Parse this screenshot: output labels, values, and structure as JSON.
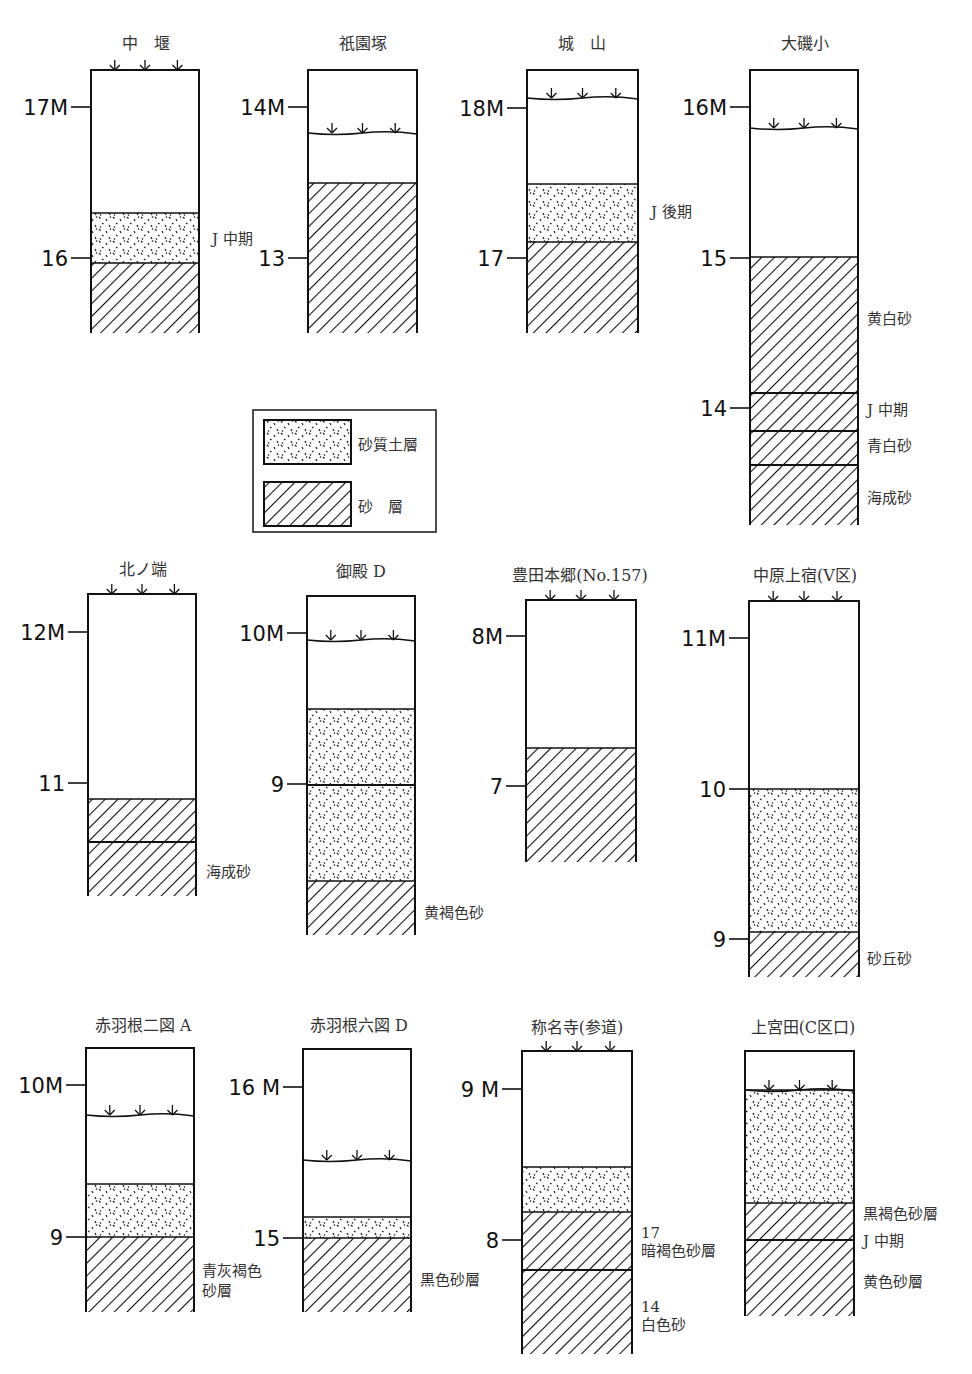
{
  "legend": {
    "items": [
      {
        "pattern": "dots",
        "label": "砂質土層"
      },
      {
        "pattern": "hatch",
        "label": "砂　層"
      }
    ],
    "box": {
      "x": 253,
      "y": 410,
      "w": 183,
      "h": 122
    }
  },
  "columns": [
    {
      "id": "nakaseki",
      "title": "中　堰",
      "titleX": 146,
      "titleY": 49,
      "x": 91,
      "w": 108,
      "top": 70,
      "bottom": 333,
      "surface": {
        "y": 70,
        "onTop": true
      },
      "ticks": [
        {
          "label": "17M",
          "y": 107
        },
        {
          "label": "16",
          "y": 258
        }
      ],
      "layers": [
        {
          "type": "dots",
          "y1": 213,
          "y2": 263
        },
        {
          "type": "hatch",
          "y1": 263,
          "y2": 333
        }
      ],
      "lines": [],
      "notes": [
        {
          "text": "J 中期",
          "x": 212,
          "y": 244
        }
      ]
    },
    {
      "id": "gionzuka",
      "title": "祇園塚",
      "titleX": 363,
      "titleY": 49,
      "x": 308,
      "w": 109,
      "top": 70,
      "bottom": 333,
      "surface": {
        "y": 133,
        "onTop": false
      },
      "ticks": [
        {
          "label": "14M",
          "y": 107
        },
        {
          "label": "13",
          "y": 258
        }
      ],
      "layers": [
        {
          "type": "hatch",
          "y1": 183,
          "y2": 333
        }
      ],
      "lines": [],
      "notes": []
    },
    {
      "id": "shiroyama",
      "title": "城　山",
      "titleX": 582,
      "titleY": 49,
      "x": 527,
      "w": 111,
      "top": 70,
      "bottom": 333,
      "surface": {
        "y": 98,
        "onTop": false
      },
      "ticks": [
        {
          "label": "18M",
          "y": 108
        },
        {
          "label": "17",
          "y": 258
        }
      ],
      "layers": [
        {
          "type": "dots",
          "y1": 184,
          "y2": 242
        },
        {
          "type": "hatch",
          "y1": 242,
          "y2": 333
        }
      ],
      "lines": [],
      "notes": [
        {
          "text": "J 後期",
          "x": 651,
          "y": 217
        }
      ]
    },
    {
      "id": "oisoshou",
      "title": "大磯小",
      "titleX": 805,
      "titleY": 49,
      "x": 750,
      "w": 108,
      "top": 70,
      "bottom": 525,
      "surface": {
        "y": 128,
        "onTop": false
      },
      "ticks": [
        {
          "label": "16M",
          "y": 107
        },
        {
          "label": "15",
          "y": 258
        },
        {
          "label": "14",
          "y": 408
        }
      ],
      "layers": [
        {
          "type": "hatch",
          "y1": 257,
          "y2": 525
        }
      ],
      "lines": [
        393,
        431,
        465
      ],
      "notes": [
        {
          "text": "黄白砂",
          "x": 867,
          "y": 324
        },
        {
          "text": "J 中期",
          "x": 867,
          "y": 415
        },
        {
          "text": "青白砂",
          "x": 867,
          "y": 451
        },
        {
          "text": "海成砂",
          "x": 867,
          "y": 503
        }
      ]
    },
    {
      "id": "kitanohata",
      "title": "北ノ端",
      "titleX": 143,
      "titleY": 575,
      "x": 88,
      "w": 108,
      "top": 594,
      "bottom": 896,
      "surface": {
        "y": 594,
        "onTop": true
      },
      "ticks": [
        {
          "label": "12M",
          "y": 632
        },
        {
          "label": "11",
          "y": 783
        }
      ],
      "layers": [
        {
          "type": "hatch",
          "y1": 799,
          "y2": 896
        }
      ],
      "lines": [
        842
      ],
      "notes": [
        {
          "text": "海成砂",
          "x": 206,
          "y": 877
        }
      ]
    },
    {
      "id": "gotenD",
      "title": "御殿 D",
      "titleX": 361,
      "titleY": 577,
      "x": 307,
      "w": 108,
      "top": 596,
      "bottom": 935,
      "surface": {
        "y": 640,
        "onTop": false
      },
      "ticks": [
        {
          "label": "10M",
          "y": 633
        },
        {
          "label": "9",
          "y": 784
        }
      ],
      "layers": [
        {
          "type": "dots",
          "y1": 709,
          "y2": 881
        },
        {
          "type": "hatch",
          "y1": 881,
          "y2": 935
        }
      ],
      "lines": [
        785
      ],
      "notes": [
        {
          "text": "黄褐色砂",
          "x": 424,
          "y": 918
        }
      ]
    },
    {
      "id": "toyodahongou",
      "title": "豊田本郷(No.157)",
      "titleX": 580,
      "titleY": 581,
      "x": 526,
      "w": 110,
      "top": 600,
      "bottom": 862,
      "surface": {
        "y": 600,
        "onTop": true
      },
      "ticks": [
        {
          "label": "8M",
          "y": 636
        },
        {
          "label": "7",
          "y": 786
        }
      ],
      "layers": [
        {
          "type": "hatch",
          "y1": 748,
          "y2": 862
        }
      ],
      "lines": [],
      "notes": []
    },
    {
      "id": "nakaharakamishuku",
      "title": "中原上宿(V区)",
      "titleX": 805,
      "titleY": 581,
      "x": 749,
      "w": 110,
      "top": 601,
      "bottom": 977,
      "surface": {
        "y": 601,
        "onTop": true
      },
      "ticks": [
        {
          "label": "11M",
          "y": 638
        },
        {
          "label": "10",
          "y": 789
        },
        {
          "label": "9",
          "y": 939
        }
      ],
      "layers": [
        {
          "type": "dots",
          "y1": 789,
          "y2": 932
        },
        {
          "type": "hatch",
          "y1": 932,
          "y2": 977
        }
      ],
      "lines": [],
      "notes": [
        {
          "text": "砂丘砂",
          "x": 867,
          "y": 964
        }
      ]
    },
    {
      "id": "akabane2A",
      "title": "赤羽根二図 A",
      "titleX": 143,
      "titleY": 1031,
      "x": 86,
      "w": 108,
      "top": 1048,
      "bottom": 1312,
      "surface": {
        "y": 1115,
        "onTop": false
      },
      "ticks": [
        {
          "label": "10M",
          "y": 1085
        },
        {
          "label": "9",
          "y": 1237
        }
      ],
      "layers": [
        {
          "type": "dots",
          "y1": 1184,
          "y2": 1237
        },
        {
          "type": "hatch",
          "y1": 1237,
          "y2": 1312
        }
      ],
      "lines": [],
      "notes": [
        {
          "text": "青灰褐色",
          "x": 202,
          "y": 1276
        },
        {
          "text": "砂層",
          "x": 202,
          "y": 1296
        }
      ]
    },
    {
      "id": "akabane6D",
      "title": "赤羽根六図 D",
      "titleX": 359,
      "titleY": 1031,
      "x": 303,
      "w": 108,
      "top": 1049,
      "bottom": 1312,
      "surface": {
        "y": 1160,
        "onTop": false
      },
      "ticks": [
        {
          "label": "16 M",
          "y": 1087
        },
        {
          "label": "15",
          "y": 1238
        }
      ],
      "layers": [
        {
          "type": "dots",
          "y1": 1217,
          "y2": 1238
        },
        {
          "type": "hatch",
          "y1": 1238,
          "y2": 1312
        }
      ],
      "lines": [],
      "notes": [
        {
          "text": "黒色砂層",
          "x": 420,
          "y": 1285
        }
      ]
    },
    {
      "id": "shomyoji",
      "title": "称名寺(参道)",
      "titleX": 577,
      "titleY": 1033,
      "x": 522,
      "w": 110,
      "top": 1051,
      "bottom": 1354,
      "surface": {
        "y": 1051,
        "onTop": true
      },
      "ticks": [
        {
          "label": "9 M",
          "y": 1089
        },
        {
          "label": "8",
          "y": 1240
        }
      ],
      "layers": [
        {
          "type": "dots",
          "y1": 1167,
          "y2": 1212
        },
        {
          "type": "hatch",
          "y1": 1212,
          "y2": 1354
        }
      ],
      "lines": [
        1270
      ],
      "notes": [
        {
          "text": "17",
          "x": 641,
          "y": 1238
        },
        {
          "text": "暗褐色砂層",
          "x": 641,
          "y": 1256
        },
        {
          "text": "14",
          "x": 641,
          "y": 1312
        },
        {
          "text": "白色砂",
          "x": 641,
          "y": 1330
        }
      ]
    },
    {
      "id": "kamimiyata",
      "title": "上宮田(C区口)",
      "titleX": 803,
      "titleY": 1033,
      "x": 745,
      "w": 109,
      "top": 1051,
      "bottom": 1316,
      "surface": {
        "y": 1090,
        "onTop": false
      },
      "ticks": [],
      "layers": [
        {
          "type": "dots",
          "y1": 1090,
          "y2": 1203
        },
        {
          "type": "hatch",
          "y1": 1203,
          "y2": 1316
        }
      ],
      "lines": [
        1240
      ],
      "notes": [
        {
          "text": "黒褐色砂層",
          "x": 863,
          "y": 1219
        },
        {
          "text": "J 中期",
          "x": 863,
          "y": 1246
        },
        {
          "text": "黄色砂層",
          "x": 863,
          "y": 1287
        }
      ]
    }
  ]
}
